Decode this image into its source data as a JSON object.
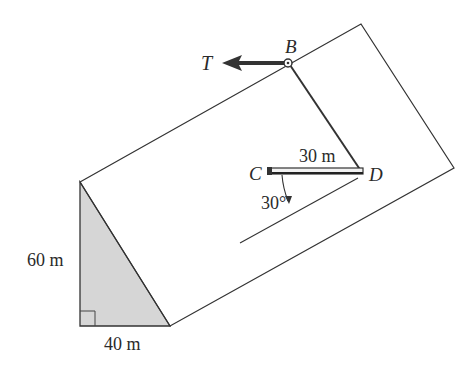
{
  "figure": {
    "type": "statics diagram"
  },
  "labels": {
    "force": "T",
    "point_b": "B",
    "point_c": "C",
    "point_d": "D",
    "bar_length": "30 m",
    "angle": "30°",
    "height": "60 m",
    "base": "40 m"
  },
  "dimensions": {
    "wedge_height_m": 60,
    "wedge_base_m": 40,
    "bar_cd_length_m": 30,
    "angle_deg": 30
  },
  "colors": {
    "stroke": "#333333",
    "wedge_fill": "#d4d4d4",
    "bar_fill": "#f2f2f2"
  }
}
